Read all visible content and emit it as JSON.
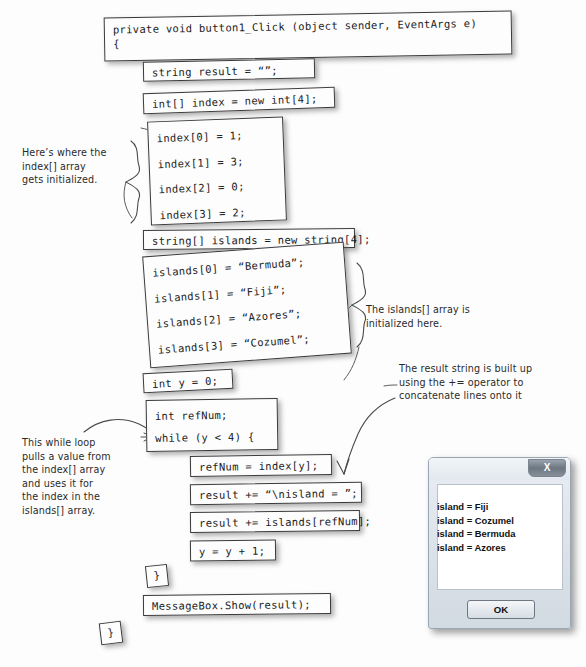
{
  "page": {
    "background_color": "#fdfdfd"
  },
  "code_blocks": [
    {
      "id": "method-signature",
      "text": "private void button1_Click (object sender, EventArgs e)\n{"
    },
    {
      "id": "declare-result",
      "text": "string result = “”;"
    },
    {
      "id": "declare-index",
      "text": "int[] index = new int[4];"
    },
    {
      "id": "index-init",
      "text": "index[0] = 1;\nindex[1] = 3;\nindex[2] = 0;\nindex[3] = 2;"
    },
    {
      "id": "declare-islands",
      "text": "string[] islands = new string[4];"
    },
    {
      "id": "islands-init",
      "text": "islands[0] = “Bermuda”;\nislands[1] = “Fiji”;\nislands[2] = “Azores”;\nislands[3] = “Cozumel”;"
    },
    {
      "id": "declare-y",
      "text": "int y = 0;"
    },
    {
      "id": "declare-refnum",
      "text": "int refNum;\nwhile (y < 4) {"
    },
    {
      "id": "assign-refnum",
      "text": "refNum = index[y];"
    },
    {
      "id": "append-label",
      "text": "result += “\\nisland = ”;"
    },
    {
      "id": "append-island",
      "text": "result += islands[refNum];"
    },
    {
      "id": "increment-y",
      "text": "y = y + 1;"
    },
    {
      "id": "close-while",
      "text": "}"
    },
    {
      "id": "show-messagebox",
      "text": "MessageBox.Show(result);"
    },
    {
      "id": "close-method",
      "text": "}"
    }
  ],
  "notes": [
    {
      "id": "note-index-init",
      "text": "Here’s where the\nindex[] array\ngets initialized."
    },
    {
      "id": "note-islands-init",
      "text": "The islands[] array is\ninitialized here."
    },
    {
      "id": "note-result-build",
      "text": "The result string is built up\nusing the += operator to\nconcatenate lines onto it"
    },
    {
      "id": "note-while-loop",
      "text": "This while loop\npulls a value from\nthe index[] array\nand uses it for\nthe index in the\nislands[] array."
    }
  ],
  "dialog": {
    "close_label": "X",
    "message": "island = Fiji\nisland = Cozumel\nisland = Bermuda\nisland = Azores",
    "ok_label": "OK"
  }
}
